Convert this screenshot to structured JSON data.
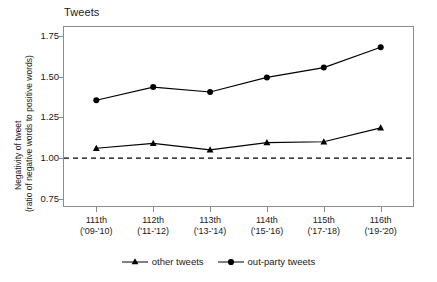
{
  "chart_data": {
    "type": "line",
    "title": "Tweets",
    "xlabel": "",
    "ylabel_line1": "Negativity of tweet",
    "ylabel_line2": "(ratio of negative words to positive words)",
    "categories": [
      "111th",
      "112th",
      "113th",
      "114th",
      "115th",
      "116th"
    ],
    "category_sublabels": [
      "('09-'10)",
      "('11-'12)",
      "('13-'14)",
      "('15-'16)",
      "('17-'18)",
      "('19-'20)"
    ],
    "series": [
      {
        "name": "other tweets",
        "marker": "triangle",
        "color": "#000000",
        "values": [
          1.06,
          1.09,
          1.05,
          1.095,
          1.1,
          1.185
        ]
      },
      {
        "name": "out-party tweets",
        "marker": "circle",
        "color": "#000000",
        "values": [
          1.355,
          1.435,
          1.405,
          1.495,
          1.555,
          1.68
        ]
      }
    ],
    "reference_line": {
      "value": 1.0,
      "style": "dashed",
      "color": "#000000"
    },
    "ylim": [
      0.7,
      1.81
    ],
    "yticks": [
      0.75,
      1.0,
      1.25,
      1.5,
      1.75
    ],
    "ytick_labels": [
      "0.75",
      "1.00",
      "1.25",
      "1.50",
      "1.75"
    ],
    "grid": false,
    "legend_position": "bottom"
  },
  "legend": {
    "items": [
      {
        "label": "other tweets",
        "marker": "triangle"
      },
      {
        "label": "out-party tweets",
        "marker": "circle"
      }
    ]
  }
}
